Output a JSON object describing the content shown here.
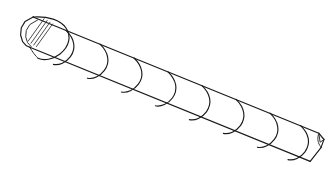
{
  "figure": {
    "title": "Spiral wound cylindrical rod",
    "style": "line-art",
    "background_color": "#ffffff",
    "stroke_color": "#1a1a1a",
    "canvas": {
      "width": 336,
      "height": 180
    },
    "parts": [
      {
        "name": "left-end-cap",
        "label": "Faceted end cap with hatching"
      },
      {
        "name": "cylinder-body",
        "label": "Cylindrical shaft"
      },
      {
        "name": "helix-seam",
        "label": "Helical spiral seam"
      },
      {
        "name": "right-end-tip",
        "label": "Chamfered tip"
      }
    ],
    "geometry": {
      "axis_start": {
        "x": 40,
        "y": 32
      },
      "axis_end": {
        "x": 312,
        "y": 146
      },
      "top_edge_start": {
        "x": 32,
        "y": 17
      },
      "top_edge_end": {
        "x": 318,
        "y": 133
      },
      "bottom_edge_start": {
        "x": 29,
        "y": 47
      },
      "bottom_edge_end": {
        "x": 310,
        "y": 161
      },
      "helix_turn_count": 8,
      "helix_turn_spacing": 34
    },
    "hatch": {
      "line_count": 4,
      "angle_label": "diagonal",
      "color": "#3a3a3a"
    }
  }
}
